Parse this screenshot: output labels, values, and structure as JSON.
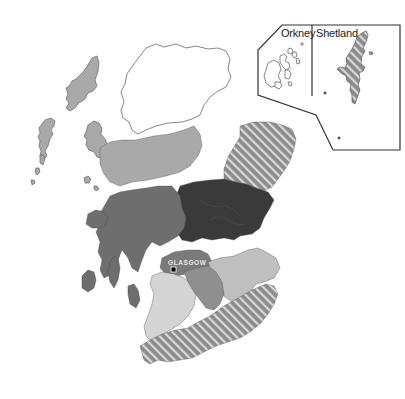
{
  "map": {
    "country": "Scotland",
    "style": "grayscale regional choropleth",
    "colors": {
      "background": "#ffffff",
      "outline": "#555555",
      "highlands_north": "#ffffff",
      "western_isles_and_central_band": "#a9a9a9",
      "west_argyll": "#6e6e6e",
      "tayside_fife": "#3a3a3a",
      "grampian_hatched": "#8c8c8c",
      "southern_hatched": "#8c8c8c",
      "hatch_line": "#d9d9d9",
      "ayrshire_southwest": "#d4d4d4",
      "lanarkshire": "#8f8f8f",
      "lothian": "#bfbfbf",
      "glasgow_band": "#7a7a7a"
    }
  },
  "insets": {
    "orkney": {
      "label": "Orkney",
      "fill": "#ffffff"
    },
    "shetland": {
      "label": "Shetland",
      "fill": "hatched"
    }
  },
  "cities": [
    {
      "name": "GLASGOW",
      "marker": "square"
    }
  ]
}
